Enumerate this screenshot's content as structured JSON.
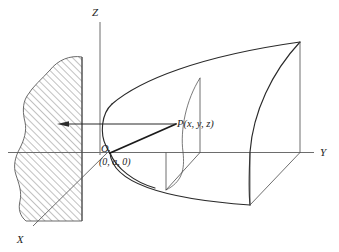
{
  "figure": {
    "kind": "3d-coordinate-diagram",
    "background_color": "#ffffff",
    "ink_color": "#1d1d1d",
    "axes": {
      "z_label": "Z",
      "y_label": "Y",
      "x_label": "X"
    },
    "labels": {
      "origin": "O",
      "origin_coords": "(0, a, 0)",
      "point": "P(x, y, z)"
    },
    "region": {
      "name": "hatched-region",
      "hatch_angle_deg": 45,
      "hatch_color": "#6b6b6b"
    },
    "annotation": {
      "pointer": "arrow-from-P-to-region"
    }
  }
}
